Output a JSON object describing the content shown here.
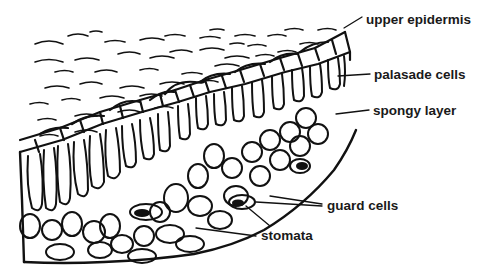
{
  "diagram": {
    "colors": {
      "ink": "#111111",
      "background": "#ffffff"
    },
    "labels": [
      {
        "id": "upper-epidermis",
        "text": "upper epidermis",
        "x": 366,
        "y": 13
      },
      {
        "id": "palasade-cells",
        "text": "palasade cells",
        "x": 374,
        "y": 68
      },
      {
        "id": "spongy-layer",
        "text": "spongy layer",
        "x": 373,
        "y": 104
      },
      {
        "id": "guard-cells",
        "text": "guard cells",
        "x": 327,
        "y": 199
      },
      {
        "id": "stomata",
        "text": "stomata",
        "x": 261,
        "y": 229
      }
    ]
  }
}
